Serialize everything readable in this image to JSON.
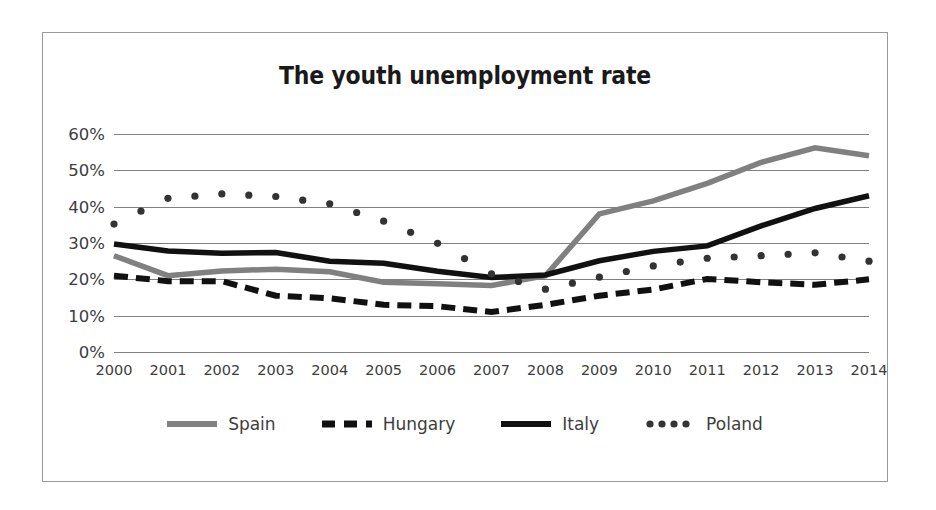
{
  "chart_data": {
    "type": "line",
    "title": "The youth unemployment rate",
    "xlabel": "",
    "ylabel": "",
    "categories": [
      "2000",
      "2001",
      "2002",
      "2003",
      "2004",
      "2005",
      "2006",
      "2007",
      "2008",
      "2009",
      "2010",
      "2011",
      "2012",
      "2013",
      "2014"
    ],
    "ylim": [
      0,
      60
    ],
    "ytick_labels": [
      "0%",
      "10%",
      "20%",
      "30%",
      "40%",
      "50%",
      "60%"
    ],
    "ytick_values": [
      0,
      10,
      20,
      30,
      40,
      50,
      60
    ],
    "grid": true,
    "legend_position": "bottom",
    "series": [
      {
        "name": "Spain",
        "style": "solid",
        "color": "#808080",
        "values": [
          26.5,
          21.0,
          22.3,
          22.8,
          22.1,
          19.2,
          18.8,
          18.3,
          21.0,
          38.0,
          41.6,
          46.4,
          52.2,
          56.2,
          54.0
        ]
      },
      {
        "name": "Hungary",
        "style": "dashed",
        "color": "#111111",
        "values": [
          21.0,
          19.5,
          19.5,
          15.5,
          14.8,
          13.0,
          12.6,
          11.0,
          13.0,
          15.5,
          17.2,
          20.1,
          19.2,
          18.5,
          20.0
        ]
      },
      {
        "name": "Italy",
        "style": "solid",
        "color": "#111111",
        "values": [
          29.7,
          27.8,
          27.2,
          27.4,
          25.0,
          24.4,
          22.2,
          20.5,
          21.2,
          25.1,
          27.7,
          29.2,
          34.7,
          39.5,
          43.0
        ]
      },
      {
        "name": "Poland",
        "style": "dotted",
        "color": "#333333",
        "values": [
          35.2,
          42.3,
          43.5,
          42.8,
          40.8,
          36.0,
          29.9,
          21.5,
          17.3,
          20.6,
          23.7,
          25.8,
          26.5,
          27.3,
          25.0
        ]
      }
    ]
  },
  "legend": {
    "items": [
      {
        "label": "Spain",
        "swatch": "line-solid-gray"
      },
      {
        "label": "Hungary",
        "swatch": "line-dashed-black"
      },
      {
        "label": "Italy",
        "swatch": "line-solid-black"
      },
      {
        "label": "Poland",
        "swatch": "line-dotted-black"
      }
    ]
  }
}
